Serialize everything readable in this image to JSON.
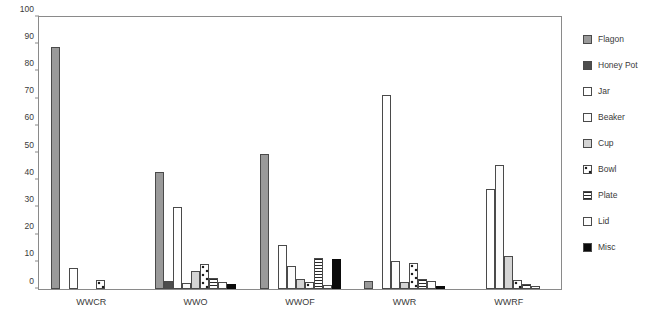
{
  "chart_data": {
    "type": "bar",
    "title": "",
    "xlabel": "",
    "ylabel": "",
    "ylim": [
      0,
      100
    ],
    "yticks": [
      0,
      10,
      20,
      30,
      40,
      50,
      60,
      70,
      80,
      90,
      100
    ],
    "grid": false,
    "legend_position": "right",
    "categories": [
      "WWCR",
      "WWO",
      "WWOF",
      "WWR",
      "WWRF"
    ],
    "series": [
      {
        "name": "Flagon",
        "key": "flagon",
        "fill": "#9a9a9a",
        "pattern": "solid-gray",
        "values": [
          89,
          43,
          49.5,
          2.8,
          0
        ]
      },
      {
        "name": "Honey Pot",
        "key": "honeypot",
        "fill": "#4d4d4d",
        "pattern": "solid-dark-gray",
        "values": [
          0,
          2.8,
          0,
          0,
          0
        ]
      },
      {
        "name": "Jar",
        "key": "jar",
        "fill": "#ffffff",
        "pattern": "open-white",
        "values": [
          7.8,
          30,
          16,
          71.5,
          36.8
        ]
      },
      {
        "name": "Beaker",
        "key": "beaker",
        "fill": "#fbfbfb",
        "pattern": "open-white",
        "values": [
          0,
          2.2,
          8.5,
          10.2,
          45.5
        ]
      },
      {
        "name": "Cup",
        "key": "cup",
        "fill": "#d4d4d4",
        "pattern": "light-gray",
        "values": [
          0,
          6.5,
          3.5,
          2.6,
          12
        ]
      },
      {
        "name": "Bowl",
        "key": "bowl",
        "fill": "#ffffff",
        "pattern": "dotted",
        "values": [
          3.4,
          9.2,
          2.5,
          9.6,
          3.4
        ]
      },
      {
        "name": "Plate",
        "key": "plate",
        "fill": "#ffffff",
        "pattern": "horizontal-stripes",
        "values": [
          0,
          4.2,
          11.5,
          3.6,
          1.8
        ]
      },
      {
        "name": "Lid",
        "key": "lid",
        "fill": "#fdfdfd",
        "pattern": "open-white",
        "values": [
          0,
          2.6,
          1.5,
          2.8,
          1.2
        ]
      },
      {
        "name": "Misc",
        "key": "misc",
        "fill": "#0b0b0b",
        "pattern": "solid-black",
        "values": [
          0,
          1.8,
          11.2,
          1.0,
          0
        ]
      }
    ]
  },
  "legend": {
    "items": [
      {
        "label": "Flagon",
        "swatch_class": "f-flagon",
        "icon": "legend-swatch-flagon"
      },
      {
        "label": "Honey Pot",
        "swatch_class": "f-honeypot",
        "icon": "legend-swatch-honey-pot"
      },
      {
        "label": "Jar",
        "swatch_class": "f-jar",
        "icon": "legend-swatch-jar"
      },
      {
        "label": "Beaker",
        "swatch_class": "f-beaker",
        "icon": "legend-swatch-beaker"
      },
      {
        "label": "Cup",
        "swatch_class": "f-cup",
        "icon": "legend-swatch-cup"
      },
      {
        "label": "Bowl",
        "swatch_class": "f-bowl",
        "icon": "legend-swatch-bowl"
      },
      {
        "label": "Plate",
        "swatch_class": "f-plate",
        "icon": "legend-swatch-plate"
      },
      {
        "label": "Lid",
        "swatch_class": "f-lid",
        "icon": "legend-swatch-lid"
      },
      {
        "label": "Misc",
        "swatch_class": "f-misc",
        "icon": "legend-swatch-misc"
      }
    ]
  },
  "colors": {
    "axis": "#8a8a8a",
    "bar_outline": "#4a4a4a",
    "text": "#3a3a3a",
    "background": "#ffffff"
  }
}
